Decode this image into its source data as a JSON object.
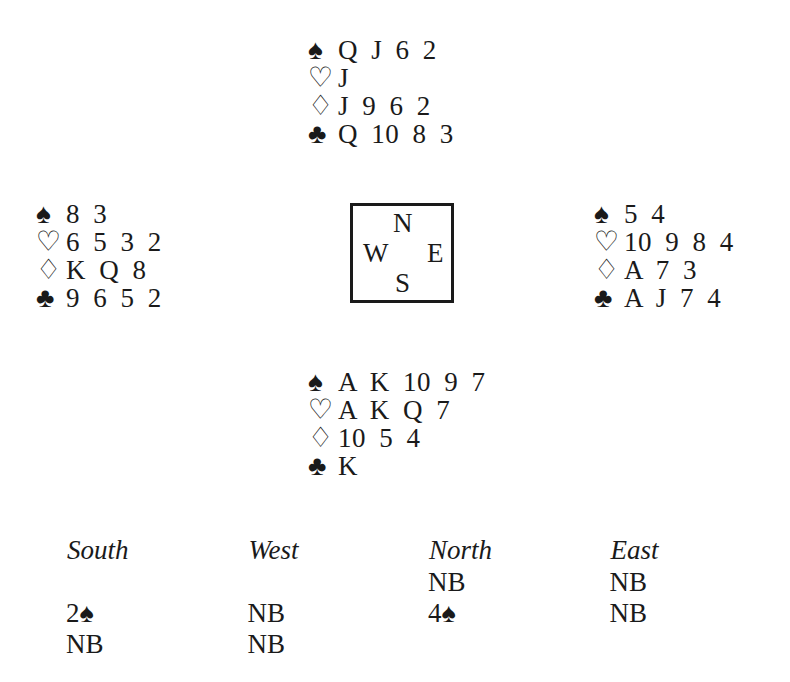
{
  "suits": {
    "spade": "♠",
    "heart": "♡",
    "diamond": "♢",
    "club": "♣"
  },
  "hands": {
    "north": {
      "spades": "Q J 6 2",
      "hearts": "J",
      "diamonds": "J 9 6 2",
      "clubs": "Q 10 8 3"
    },
    "west": {
      "spades": "8 3",
      "hearts": "6 5 3 2",
      "diamonds": "K Q 8",
      "clubs": "9 6 5 2"
    },
    "east": {
      "spades": "5 4",
      "hearts": "10 9 8 4",
      "diamonds": "A 7 3",
      "clubs": "A J 7 4"
    },
    "south": {
      "spades": "A K 10 9 7",
      "hearts": "A K Q 7",
      "diamonds": "10 5 4",
      "clubs": "K"
    }
  },
  "compass": {
    "n": "N",
    "w": "W",
    "e": "E",
    "s": "S"
  },
  "auction": {
    "headers": [
      "South",
      "West",
      "North",
      "East"
    ],
    "rows": [
      [
        "",
        "",
        "NB",
        "NB"
      ],
      [
        "2♠",
        "NB",
        "4♠",
        "NB"
      ],
      [
        "NB",
        "NB",
        "",
        ""
      ]
    ]
  }
}
